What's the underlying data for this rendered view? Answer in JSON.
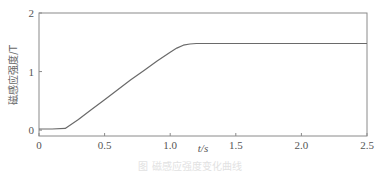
{
  "chart_data": {
    "type": "line",
    "title": "",
    "xlabel": "t/s",
    "ylabel": "磁感应强度/T",
    "xlim": [
      0,
      2.5
    ],
    "ylim": [
      -0.1,
      2
    ],
    "xticks": [
      0,
      0.5,
      1.0,
      1.5,
      2.0,
      2.5
    ],
    "xtick_labels": [
      "0",
      "0.5",
      "1.0",
      "1.5",
      "2.0",
      "2.5"
    ],
    "yticks": [
      0,
      1,
      2
    ],
    "ytick_labels": [
      "0",
      "1",
      "2"
    ],
    "grid": false,
    "legend": null,
    "series": [
      {
        "name": "磁感应强度",
        "color": "#6a6a6a",
        "x": [
          0,
          0.1,
          0.2,
          0.3,
          0.4,
          0.5,
          0.6,
          0.7,
          0.8,
          0.9,
          1.0,
          1.05,
          1.1,
          1.15,
          1.2,
          1.3,
          1.5,
          2.0,
          2.5
        ],
        "y": [
          0.02,
          0.02,
          0.03,
          0.18,
          0.35,
          0.52,
          0.69,
          0.86,
          1.02,
          1.18,
          1.33,
          1.4,
          1.45,
          1.47,
          1.48,
          1.48,
          1.48,
          1.48,
          1.48
        ]
      }
    ]
  },
  "caption": "图  磁感应强度变化曲线"
}
